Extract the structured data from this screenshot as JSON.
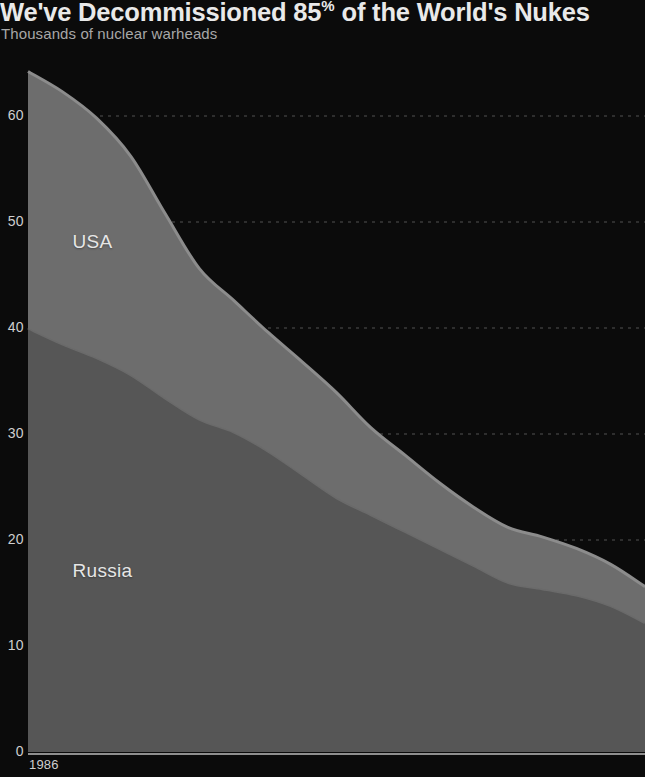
{
  "header": {
    "title_prefix": "We've Decommissioned 85",
    "title_percent": "%",
    "title_suffix": " of the World's Nukes",
    "subtitle": "Thousands of nuclear warheads"
  },
  "colors": {
    "background": "#0b0b0b",
    "usa_fill": "#6d6d6d",
    "usa_edge": "#8c8c8c",
    "russia_fill": "#565656",
    "russia_edge": "#6a6a6a",
    "gridline": "#6a6a6a",
    "axis": "#8f8f8f",
    "tick_text": "#cfcfcf",
    "title_text": "#e9e9e9",
    "subtitle_text": "#a7a7a7",
    "series_text": "#e6e6e6"
  },
  "chart_data": {
    "type": "area",
    "stacked": true,
    "title": "We've Decommissioned 85% of the World's Nukes",
    "subtitle": "Thousands of nuclear warheads",
    "xlabel": "",
    "ylabel": "Thousands of nuclear warheads",
    "ylim": [
      0,
      66
    ],
    "xlim": [
      1986,
      2022
    ],
    "grid": true,
    "grid_axis": "y",
    "grid_style": "dotted",
    "legend_position": "inline-area-labels",
    "ytick_labels": [
      "0",
      "10",
      "20",
      "30",
      "40",
      "50",
      "60"
    ],
    "yticks": [
      0,
      10,
      20,
      30,
      40,
      50,
      60
    ],
    "xtick_labels": [
      "1986"
    ],
    "xticks": [
      1986
    ],
    "x": [
      1986,
      1988,
      1990,
      1992,
      1994,
      1996,
      1998,
      2000,
      2002,
      2004,
      2006,
      2008,
      2010,
      2012,
      2014,
      2016,
      2018,
      2020,
      2022
    ],
    "series": [
      {
        "name": "Russia",
        "label_xy": [
          1988.6,
          17.0
        ],
        "values": [
          40.0,
          38.5,
          37.2,
          35.6,
          33.4,
          31.4,
          30.2,
          28.4,
          26.2,
          24.0,
          22.4,
          20.8,
          19.2,
          17.6,
          16.0,
          15.4,
          14.8,
          13.8,
          12.2
        ]
      },
      {
        "name": "USA",
        "label_xy": [
          1988.6,
          48.0
        ],
        "values": [
          24.2,
          23.8,
          22.6,
          20.6,
          17.4,
          14.2,
          12.4,
          11.2,
          10.6,
          9.9,
          8.2,
          7.2,
          6.2,
          5.5,
          5.2,
          4.9,
          4.4,
          3.9,
          3.4
        ]
      }
    ],
    "totals": [
      64.2,
      62.3,
      59.8,
      56.2,
      50.8,
      45.6,
      42.6,
      39.6,
      36.8,
      33.9,
      30.6,
      28.0,
      25.4,
      23.1,
      21.2,
      20.3,
      19.2,
      17.7,
      15.6
    ],
    "annotations": [
      {
        "text": "USA",
        "series": "USA"
      },
      {
        "text": "Russia",
        "series": "Russia"
      }
    ]
  },
  "geometry": {
    "x_left_px": 28,
    "x_right_px": 645,
    "y_zero_px": 752,
    "y_per_unit_px": 10.6,
    "axis_line_y_px": 754
  }
}
